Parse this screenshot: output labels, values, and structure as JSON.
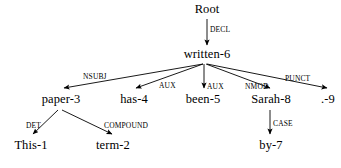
{
  "figure": {
    "type": "dependency-parse-tree",
    "sentence": "This term paper has been written by Sarah .",
    "background_color": "#ffffff",
    "line_color": "#000000",
    "text_color": "#000000"
  },
  "nodes": [
    {
      "id": "root",
      "label": "Root",
      "x": 207,
      "y": 3,
      "level": 0
    },
    {
      "id": "written",
      "label": "written-6",
      "x": 207,
      "y": 48,
      "level": 1
    },
    {
      "id": "paper",
      "label": "paper-3",
      "x": 61,
      "y": 93,
      "level": 2
    },
    {
      "id": "has",
      "label": "has-4",
      "x": 134,
      "y": 93,
      "level": 2
    },
    {
      "id": "been",
      "label": "been-5",
      "x": 203,
      "y": 93,
      "level": 2
    },
    {
      "id": "sarah",
      "label": "Sarah-8",
      "x": 271,
      "y": 93,
      "level": 2
    },
    {
      "id": "punct",
      "label": ".-9",
      "x": 328,
      "y": 93,
      "level": 2
    },
    {
      "id": "this",
      "label": "This-1",
      "x": 31,
      "y": 139,
      "level": 3
    },
    {
      "id": "term",
      "label": "term-2",
      "x": 113,
      "y": 139,
      "level": 3
    },
    {
      "id": "by",
      "label": "by-7",
      "x": 271,
      "y": 139,
      "level": 3
    }
  ],
  "edges": [
    {
      "id": "e-decl",
      "label": "DECL",
      "from": "root",
      "to": "written",
      "x1": 207,
      "y1": 19,
      "x2": 207,
      "y2": 45,
      "label_x": 210,
      "label_y": 26
    },
    {
      "id": "e-nsubj",
      "label": "NSUBJ",
      "from": "written",
      "to": "paper",
      "x1": 203,
      "y1": 64,
      "x2": 64,
      "y2": 88,
      "label_x": 83,
      "label_y": 73
    },
    {
      "id": "e-aux-has",
      "label": "AUX",
      "from": "written",
      "to": "has",
      "x1": 203,
      "y1": 64,
      "x2": 136,
      "y2": 88,
      "label_x": 159,
      "label_y": 82
    },
    {
      "id": "e-aux-been",
      "label": "AUX",
      "from": "written",
      "to": "been",
      "x1": 204,
      "y1": 64,
      "x2": 204,
      "y2": 88,
      "label_x": 207,
      "label_y": 83
    },
    {
      "id": "e-nmod",
      "label": "NMOD",
      "from": "written",
      "to": "sarah",
      "x1": 206,
      "y1": 64,
      "x2": 270,
      "y2": 88,
      "label_x": 245,
      "label_y": 83
    },
    {
      "id": "e-punct",
      "label": "PUNCT",
      "from": "written",
      "to": "punct",
      "x1": 207,
      "y1": 64,
      "x2": 327,
      "y2": 88,
      "label_x": 285,
      "label_y": 75
    },
    {
      "id": "e-det",
      "label": "DET",
      "from": "paper",
      "to": "this",
      "x1": 58,
      "y1": 110,
      "x2": 33,
      "y2": 134,
      "label_x": 26,
      "label_y": 122
    },
    {
      "id": "e-compound",
      "label": "COMPOUND",
      "from": "paper",
      "to": "term",
      "x1": 62,
      "y1": 110,
      "x2": 112,
      "y2": 134,
      "label_x": 104,
      "label_y": 122
    },
    {
      "id": "e-case",
      "label": "CASE",
      "from": "sarah",
      "to": "by",
      "x1": 270,
      "y1": 110,
      "x2": 270,
      "y2": 134,
      "label_x": 273,
      "label_y": 120
    }
  ]
}
